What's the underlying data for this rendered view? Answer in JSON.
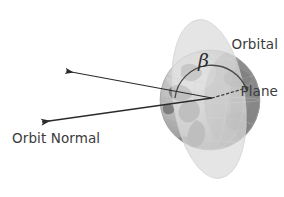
{
  "figure": {
    "kind": "orbital-beta-angle-diagram",
    "background_color": "#ffffff",
    "width": 284,
    "height": 197
  },
  "labels": {
    "orbital_plane_line1": "Orbital",
    "orbital_plane_line2": "Plane",
    "orbit_normal": "Orbit Normal",
    "beta_symbol": "β"
  },
  "colors": {
    "text": "#3b3b3b",
    "beta_text": "#2e2e2e",
    "arrow": "#2b2b2b",
    "orbital_plane_fill": "#dcdcdc",
    "orbital_plane_fill_front": "#e2e2e2",
    "globe_light": "#c8c8c8",
    "globe_mid": "#a8a8a8",
    "globe_dark": "#8a8a8a",
    "globe_land": "#7d7d7d",
    "grid_line": "#b4b4b4",
    "arc": "#4a4a4a",
    "dotted_line": "#3a3a3a"
  },
  "geometry": {
    "globe_center_x": 210,
    "globe_center_y": 100,
    "globe_radius": 50,
    "vertex_x": 212,
    "vertex_y": 98,
    "upper_arrow_tip_x": 63,
    "upper_arrow_tip_y": 70,
    "lower_arrow_tip_x": 38,
    "lower_arrow_tip_y": 123,
    "dotted_end_x": 250,
    "dotted_end_y": 87,
    "arc_radius": 37,
    "plane_ellipse_cx": 209,
    "plane_ellipse_cy": 99,
    "plane_ellipse_rx": 36,
    "plane_ellipse_ry": 80,
    "plane_rotation_deg": -8
  },
  "annotations": {
    "angle_name": "beta",
    "angle_between": "orbit-normal-vector and orbital-plane-reference-line"
  }
}
